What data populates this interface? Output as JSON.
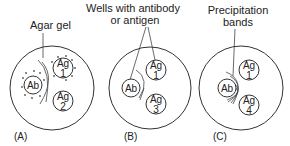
{
  "labels": {
    "agar_gel": "Agar gel",
    "wells_line1": "Wells with antibody",
    "wells_line2": "or antigen",
    "precip_line1": "Precipitation",
    "precip_line2": "bands"
  },
  "panels": [
    {
      "caption": "(A)",
      "wells": [
        {
          "top": "Ab",
          "bottom": ""
        },
        {
          "top": "Ag",
          "bottom": "1"
        },
        {
          "top": "Ag",
          "bottom": "2"
        }
      ]
    },
    {
      "caption": "(B)",
      "wells": [
        {
          "top": "Ab",
          "bottom": ""
        },
        {
          "top": "Ag",
          "bottom": "1"
        },
        {
          "top": "Ag",
          "bottom": "3"
        }
      ]
    },
    {
      "caption": "(C)",
      "wells": [
        {
          "top": "Ab",
          "bottom": ""
        },
        {
          "top": "Ag",
          "bottom": "1"
        },
        {
          "top": "Ag",
          "bottom": "4"
        }
      ]
    }
  ]
}
